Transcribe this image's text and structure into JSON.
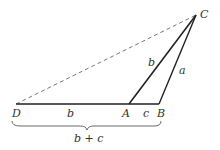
{
  "diagram": {
    "points": {
      "C": {
        "label": "C",
        "x": 196,
        "y": 15
      },
      "D": {
        "label": "D",
        "x": 16,
        "y": 104
      },
      "A": {
        "label": "A",
        "x": 129,
        "y": 104
      },
      "B": {
        "label": "B",
        "x": 159,
        "y": 104
      }
    },
    "segments": [
      {
        "from": "D",
        "to": "B",
        "style": "solid",
        "labels": [
          "b",
          "c"
        ]
      },
      {
        "from": "A",
        "to": "C",
        "style": "solid",
        "label": "b"
      },
      {
        "from": "B",
        "to": "C",
        "style": "solid",
        "label": "a"
      },
      {
        "from": "D",
        "to": "C",
        "style": "dashed"
      }
    ],
    "edge_labels": {
      "AC": "b",
      "BC": "a",
      "DA": "b",
      "AB": "c"
    },
    "brace_label": "b + c",
    "colors": {
      "line": "#222222",
      "dashed": "#555555",
      "text": "#333333"
    }
  }
}
